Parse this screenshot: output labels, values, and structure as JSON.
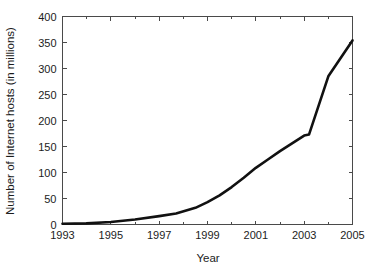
{
  "chart_data": {
    "type": "line",
    "title": "",
    "xlabel": "Year",
    "ylabel": "Number of Internet hosts (in millions)",
    "xlim": [
      1993,
      2005
    ],
    "ylim": [
      0,
      400
    ],
    "xticks": [
      1993,
      1995,
      1997,
      1999,
      2001,
      2003,
      2005
    ],
    "xtick_labels": [
      "1993",
      "1995",
      "1997",
      "1999",
      "2001",
      "2003",
      "2005"
    ],
    "yticks": [
      0,
      50,
      100,
      150,
      200,
      250,
      300,
      350,
      400
    ],
    "ytick_labels": [
      "0",
      "50",
      "100",
      "150",
      "200",
      "250",
      "300",
      "350",
      "400"
    ],
    "xtick_minor": [
      1994,
      1996,
      1998,
      2000,
      2002,
      2004
    ],
    "grid": false,
    "legend": null,
    "series": [
      {
        "name": "Internet hosts",
        "color": "#111111",
        "x": [
          1993,
          1994,
          1995,
          1996,
          1997,
          1997.7,
          1998.5,
          1999,
          1999.5,
          2000,
          2000.5,
          2001,
          2001.5,
          2002,
          2002.5,
          2003,
          2003.2,
          2004,
          2005
        ],
        "values": [
          1.3,
          2.2,
          4.9,
          9.5,
          16.1,
          21,
          32,
          43,
          56,
          72,
          90,
          109,
          125,
          141,
          156,
          171,
          173,
          285,
          354
        ]
      }
    ]
  },
  "axes": {
    "x_title": "Year",
    "y_title": "Number of Internet hosts (in millions)"
  }
}
